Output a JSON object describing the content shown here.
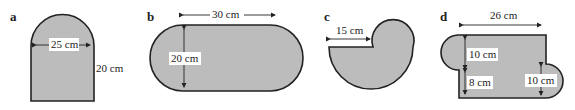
{
  "figures": [
    {
      "letter": "a",
      "shape": "rectangle-with-semicircle-top",
      "labels": {
        "width": "25 cm",
        "height": "20 cm"
      }
    },
    {
      "letter": "b",
      "shape": "stadium",
      "labels": {
        "length": "30 cm",
        "height": "20 cm"
      }
    },
    {
      "letter": "c",
      "shape": "three-quarter-circle-with-semicircle",
      "labels": {
        "radius": "15 cm"
      }
    },
    {
      "letter": "d",
      "shape": "rectangle-with-two-semicircles",
      "labels": {
        "width": "26 cm",
        "upper": "10 cm",
        "lower": "8 cm",
        "right": "10 cm"
      }
    }
  ],
  "colors": {
    "fill": "#bcbcbc",
    "stroke": "#222222"
  }
}
